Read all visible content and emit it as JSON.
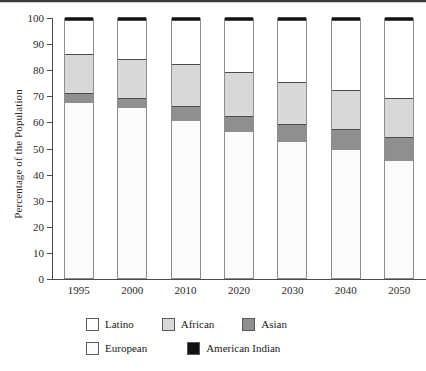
{
  "chart_data": {
    "type": "bar",
    "stacked": true,
    "title": "",
    "subtitle": "",
    "xlabel": "",
    "ylabel": "Percentage of the Population",
    "ylim": [
      0,
      100
    ],
    "ytick_step": 10,
    "yticks": [
      0,
      10,
      20,
      30,
      40,
      50,
      60,
      70,
      80,
      90,
      100
    ],
    "grid": false,
    "legend_position": "bottom",
    "categories": [
      "1995",
      "2000",
      "2010",
      "2020",
      "2030",
      "2040",
      "2050"
    ],
    "series": [
      {
        "name": "European",
        "color": "#fbfbfb",
        "values": [
          67,
          65,
          60,
          56,
          52,
          49,
          45
        ]
      },
      {
        "name": "Asian",
        "color": "#8f8f8f",
        "values": [
          4,
          4,
          6,
          6,
          7,
          8,
          9
        ]
      },
      {
        "name": "African",
        "color": "#d8d8d8",
        "values": [
          15,
          15,
          16,
          17,
          16,
          15,
          15
        ]
      },
      {
        "name": "Latino",
        "color": "#ffffff",
        "values": [
          13,
          15,
          17,
          20,
          24,
          27,
          30
        ]
      },
      {
        "name": "American Indian",
        "color": "#111111",
        "values": [
          1,
          1,
          1,
          1,
          1,
          1,
          1
        ]
      }
    ],
    "cumulative_tops": {
      "European": [
        67,
        65,
        60,
        56,
        52,
        49,
        45
      ],
      "Asian": [
        71,
        69,
        66,
        62,
        59,
        57,
        54
      ],
      "African": [
        86,
        84,
        82,
        79,
        75,
        72,
        69
      ],
      "Latino": [
        99,
        99,
        99,
        99,
        99,
        99,
        99
      ],
      "American Indian": [
        100,
        100,
        100,
        100,
        100,
        100,
        100
      ]
    }
  },
  "axis": {
    "y_title": "Percentage of the Population",
    "y_tick_labels": [
      "100",
      "90",
      "80",
      "70",
      "60",
      "50",
      "40",
      "30",
      "20",
      "10",
      "0"
    ],
    "x_tick_labels": [
      "1995",
      "2000",
      "2010",
      "2020",
      "2030",
      "2040",
      "2050"
    ]
  },
  "legend": {
    "row1": [
      {
        "label": "Latino",
        "swatch": "latino"
      },
      {
        "label": "African",
        "swatch": "african"
      },
      {
        "label": "Asian",
        "swatch": "asian"
      }
    ],
    "row2": [
      {
        "label": "European",
        "swatch": "european"
      },
      {
        "label": "American Indian",
        "swatch": "amerindian"
      }
    ]
  }
}
